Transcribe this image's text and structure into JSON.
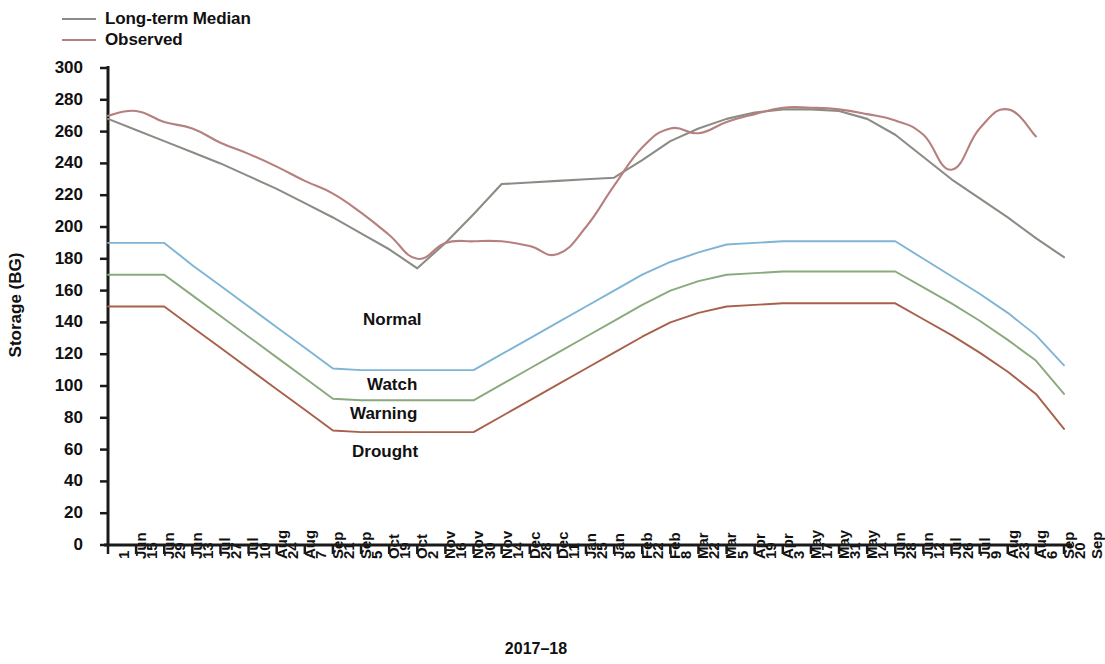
{
  "legend": {
    "items": [
      {
        "label": "Long-term Median",
        "color": "#8c8c86",
        "key": "median"
      },
      {
        "label": "Observed",
        "color": "#b5807f",
        "key": "observed"
      }
    ]
  },
  "axes": {
    "ylabel": "Storage (BG)",
    "xlabel": "2017–18",
    "yticks": [
      0,
      20,
      40,
      60,
      80,
      100,
      120,
      140,
      160,
      180,
      200,
      220,
      240,
      260,
      280,
      300
    ],
    "ylim": [
      0,
      300
    ],
    "xticks": [
      "1 Jun",
      "15 Jun",
      "29 Jun",
      "13 Jul",
      "27 Jul",
      "10 Aug",
      "24 Aug",
      "7 Sep",
      "21 Sep",
      "5 Oct",
      "19 Oct",
      "2 Nov",
      "16 Nov",
      "30 Nov",
      "14 Dec",
      "28 Dec",
      "11 Jan",
      "25 Jan",
      "8 Feb",
      "22 Feb",
      "8 Mar",
      "22 Mar",
      "5 Apr",
      "19 Apr",
      "3 May",
      "17 May",
      "31 May",
      "14 Jun",
      "28 Jun",
      "12 Jul",
      "26 Jul",
      "9 Aug",
      "23 Aug",
      "6 Sep",
      "20 Sep"
    ]
  },
  "band_labels": [
    {
      "text": "Normal",
      "x": 363,
      "y": 310
    },
    {
      "text": "Watch",
      "x": 367,
      "y": 375
    },
    {
      "text": "Warning",
      "x": 350,
      "y": 404
    },
    {
      "text": "Drought",
      "x": 352,
      "y": 442
    }
  ],
  "colors": {
    "normal_threshold": "#7fb4d4",
    "watch_threshold": "#8aa97c",
    "warning_threshold": "#a9604a",
    "median": "#8c8c86",
    "observed": "#b5807f",
    "axis": "#1a1a1a",
    "background": "#ffffff"
  },
  "chart_data": {
    "type": "line",
    "title": "",
    "xlabel": "2017–18",
    "ylabel": "Storage (BG)",
    "ylim": [
      0,
      300
    ],
    "grid": false,
    "legend_position": "top-left",
    "x": [
      "1 Jun",
      "15 Jun",
      "29 Jun",
      "13 Jul",
      "27 Jul",
      "10 Aug",
      "24 Aug",
      "7 Sep",
      "21 Sep",
      "5 Oct",
      "19 Oct",
      "2 Nov",
      "16 Nov",
      "30 Nov",
      "14 Dec",
      "28 Dec",
      "11 Jan",
      "25 Jan",
      "8 Feb",
      "22 Feb",
      "8 Mar",
      "22 Mar",
      "5 Apr",
      "19 Apr",
      "3 May",
      "17 May",
      "31 May",
      "14 Jun",
      "28 Jun",
      "12 Jul",
      "26 Jul",
      "9 Aug",
      "23 Aug",
      "6 Sep",
      "20 Sep"
    ],
    "series": [
      {
        "name": "Long-term Median",
        "color": "#8c8c86",
        "values": [
          268,
          261,
          254,
          247,
          240,
          232,
          224,
          215,
          206,
          196,
          186,
          174,
          190,
          208,
          227,
          228,
          229,
          230,
          231,
          242,
          254,
          262,
          268,
          272,
          274,
          274,
          273,
          268,
          258,
          244,
          230,
          218,
          206,
          193,
          181
        ]
      },
      {
        "name": "Observed",
        "color": "#b5807f",
        "values": [
          270,
          273,
          266,
          262,
          253,
          246,
          238,
          229,
          221,
          209,
          195,
          180,
          190,
          191,
          191,
          188,
          183,
          200,
          226,
          250,
          262,
          259,
          266,
          271,
          275,
          275,
          274,
          271,
          267,
          258,
          236,
          262,
          274,
          257,
          null
        ]
      },
      {
        "name": "Normal threshold",
        "color": "#7fb4d4",
        "values": [
          190,
          190,
          190,
          176,
          163,
          150,
          137,
          124,
          111,
          110,
          110,
          110,
          110,
          110,
          120,
          130,
          140,
          150,
          160,
          170,
          178,
          184,
          189,
          190,
          191,
          191,
          191,
          191,
          191,
          180,
          169,
          158,
          146,
          132,
          113
        ]
      },
      {
        "name": "Watch threshold",
        "color": "#8aa97c",
        "values": [
          170,
          170,
          170,
          157,
          144,
          131,
          118,
          105,
          92,
          91,
          91,
          91,
          91,
          91,
          101,
          111,
          121,
          131,
          141,
          151,
          160,
          166,
          170,
          171,
          172,
          172,
          172,
          172,
          172,
          162,
          152,
          141,
          129,
          116,
          95
        ]
      },
      {
        "name": "Warning threshold",
        "color": "#a9604a",
        "values": [
          150,
          150,
          150,
          137,
          124,
          111,
          98,
          85,
          72,
          71,
          71,
          71,
          71,
          71,
          81,
          91,
          101,
          111,
          121,
          131,
          140,
          146,
          150,
          151,
          152,
          152,
          152,
          152,
          152,
          142,
          132,
          121,
          109,
          95,
          73
        ]
      }
    ],
    "band_annotations": [
      "Normal",
      "Watch",
      "Warning",
      "Drought"
    ]
  }
}
